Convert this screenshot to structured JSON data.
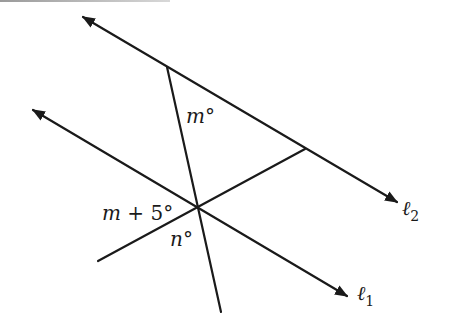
{
  "diagram": {
    "type": "geometry",
    "colors": {
      "stroke": "#1a1a1a",
      "background": "#ffffff"
    },
    "lines": {
      "l2": {
        "name": "ℓ",
        "subscript": "2",
        "from": [
          83,
          17
        ],
        "to": [
          397,
          202
        ],
        "arrows": "both"
      },
      "l1": {
        "name": "ℓ",
        "subscript": "1",
        "from": [
          33,
          110
        ],
        "to": [
          347,
          296
        ],
        "arrows": "both"
      },
      "transversal": {
        "from": [
          167,
          67
        ],
        "to": [
          221,
          312
        ]
      },
      "second_segment": {
        "from": [
          98,
          261
        ],
        "to": [
          305,
          149
        ]
      }
    },
    "angle_labels": {
      "top": {
        "var": "m",
        "degree": "°"
      },
      "left": {
        "text": "m + 5°",
        "var": "m",
        "op": " + 5",
        "degree": "°"
      },
      "bottom": {
        "var": "n",
        "degree": "°"
      }
    }
  }
}
